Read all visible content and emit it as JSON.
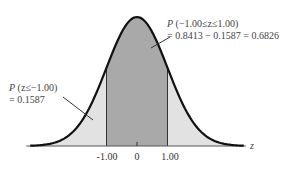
{
  "chart_data": {
    "type": "area",
    "title": "",
    "distribution": "standard normal",
    "xlabel": "z",
    "ylabel": "",
    "xlim": [
      -3.5,
      3.5
    ],
    "tick_labels": [
      "-1.00",
      "0",
      "1.00"
    ],
    "tick_values": [
      -1,
      0,
      1
    ],
    "shaded_regions": [
      {
        "name": "left-tail",
        "from": -3.5,
        "to": -1,
        "shade": "light"
      },
      {
        "name": "central",
        "from": -1,
        "to": 1,
        "shade": "dark"
      },
      {
        "name": "right-tail",
        "from": 1,
        "to": 3.5,
        "shade": "light"
      }
    ],
    "annotations": [
      {
        "id": "central",
        "line1_prefix": "P",
        "line1_rest": " (−1.00≤z≤1.00)",
        "line2": "= 0.8413 − 0.1587 = 0.6826",
        "value": 0.6826
      },
      {
        "id": "left",
        "line1_prefix": "P",
        "line1_rest": " (z≤−1.00)",
        "line2": "= 0.1587",
        "value": 0.1587
      }
    ]
  },
  "colors": {
    "dark_fill": "#a9a9a9",
    "light_fill": "#e2e2e2",
    "curve": "#111111"
  }
}
